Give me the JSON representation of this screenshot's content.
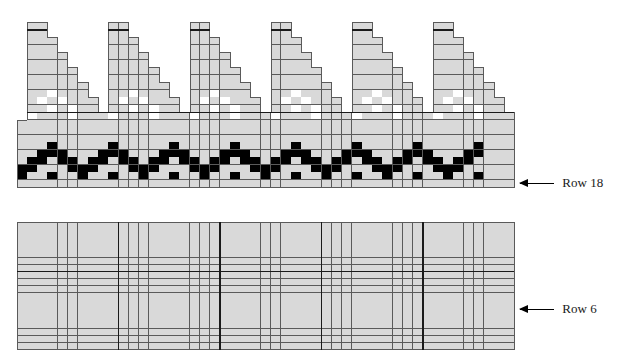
{
  "colors": {
    "cell": "#d9d9d9",
    "white_cell": "#ffffff",
    "black_cell": "#000000",
    "grid_line": "#5a5a5a"
  },
  "top_chart": {
    "origin_x": 17,
    "origin_y": 22,
    "cell_w": 10.15,
    "cell_h": 7.5,
    "cols": 49,
    "rows": 22,
    "triangles": {
      "start_cols": [
        1,
        9,
        17,
        25,
        33,
        41
      ],
      "top_width": 2,
      "rows": 12
    },
    "row13_start_col": 1,
    "white_offsets": [
      [
        9,
        2
      ],
      [
        10,
        1
      ],
      [
        10,
        3
      ],
      [
        11,
        2
      ],
      [
        11,
        4
      ],
      [
        12,
        0
      ],
      [
        12,
        4
      ]
    ],
    "band": {
      "start_row": 16,
      "period": 6,
      "max_col": 45,
      "rows": [
        [
          3
        ],
        [
          2,
          3,
          4
        ],
        [
          1,
          2,
          4,
          5
        ],
        [
          0,
          1,
          5
        ],
        [
          0,
          3
        ]
      ]
    },
    "label": {
      "text": "Row 18",
      "arrow": "left-arrow-icon",
      "y": 183
    }
  },
  "bottom_chart": {
    "origin_x": 17,
    "origin_y": 222,
    "cell_w": 10.15,
    "cell_h": 7.1,
    "cols": 49,
    "rows": 18,
    "heavy_col_every": 10,
    "heavy_row_after": 7,
    "label": {
      "text": "Row 6",
      "arrow": "left-arrow-icon",
      "y": 309
    }
  }
}
